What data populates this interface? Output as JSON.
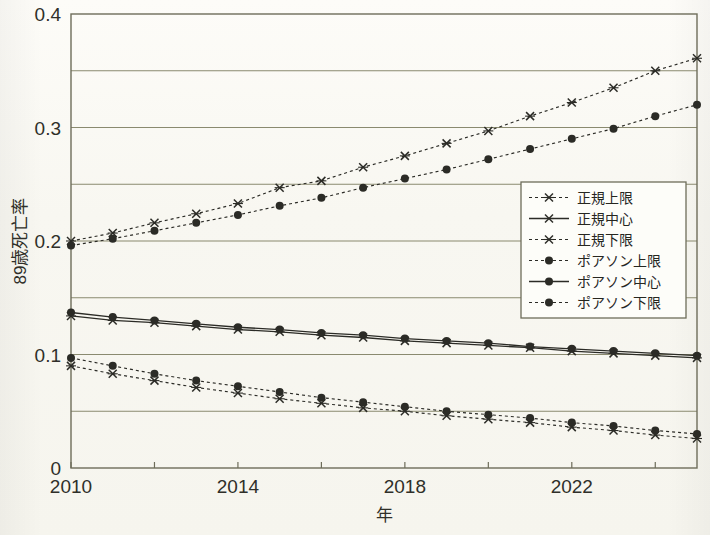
{
  "figure": {
    "background_color": "#fbfaf6",
    "frame_color": "#6e6d5a",
    "grid_color": "#8a8a6f",
    "ink_color": "#2b2b26"
  },
  "axes": {
    "y_title": "89歳死亡率",
    "x_title": "年",
    "y_tick_labels": [
      "0.4",
      "0.3",
      "0.2",
      "0.1",
      "0"
    ],
    "x_tick_labels": [
      "2010",
      "2014",
      "2018",
      "2022"
    ]
  },
  "legend": {
    "position": "center-right",
    "items": [
      {
        "label": "正規上限",
        "marker": "cross-marker",
        "line": "dashed"
      },
      {
        "label": "正規中心",
        "marker": "cross-marker",
        "line": "solid"
      },
      {
        "label": "正規下限",
        "marker": "cross-marker",
        "line": "dashed"
      },
      {
        "label": "ポアソン上限",
        "marker": "circle-marker",
        "line": "dashed"
      },
      {
        "label": "ポアソン中心",
        "marker": "circle-marker",
        "line": "solid"
      },
      {
        "label": "ポアソン下限",
        "marker": "circle-marker",
        "line": "dashed"
      }
    ]
  },
  "chart_data": {
    "type": "line",
    "title": "",
    "xlabel": "年",
    "ylabel": "89歳死亡率",
    "xlim": [
      2010,
      2025
    ],
    "ylim": [
      0,
      0.4
    ],
    "yticks": [
      0,
      0.05,
      0.1,
      0.15,
      0.2,
      0.25,
      0.3,
      0.35,
      0.4
    ],
    "ytick_labeled": [
      0,
      0.1,
      0.2,
      0.3,
      0.4
    ],
    "xticks": [
      2010,
      2012,
      2014,
      2016,
      2018,
      2020,
      2022,
      2024
    ],
    "xtick_labeled": [
      2010,
      2014,
      2018,
      2022
    ],
    "grid": "horizontal",
    "legend_position": "center-right",
    "x": [
      2010,
      2011,
      2012,
      2013,
      2014,
      2015,
      2016,
      2017,
      2018,
      2019,
      2020,
      2021,
      2022,
      2023,
      2024,
      2025
    ],
    "series": [
      {
        "name": "正規上限",
        "marker": "cross-marker",
        "line": "dashed",
        "values": [
          0.2,
          0.207,
          0.216,
          0.224,
          0.233,
          0.247,
          0.253,
          0.265,
          0.275,
          0.286,
          0.297,
          0.31,
          0.322,
          0.335,
          0.35,
          0.361
        ]
      },
      {
        "name": "正規中心",
        "marker": "cross-marker",
        "line": "solid",
        "values": [
          0.134,
          0.13,
          0.128,
          0.125,
          0.122,
          0.12,
          0.117,
          0.115,
          0.112,
          0.11,
          0.108,
          0.106,
          0.103,
          0.101,
          0.099,
          0.097
        ]
      },
      {
        "name": "正規下限",
        "marker": "cross-marker",
        "line": "dashed",
        "values": [
          0.09,
          0.083,
          0.077,
          0.071,
          0.066,
          0.061,
          0.057,
          0.053,
          0.05,
          0.046,
          0.043,
          0.04,
          0.036,
          0.033,
          0.029,
          0.026
        ]
      },
      {
        "name": "ポアソン上限",
        "marker": "circle-marker",
        "line": "dashed",
        "values": [
          0.196,
          0.202,
          0.209,
          0.216,
          0.223,
          0.231,
          0.238,
          0.247,
          0.255,
          0.263,
          0.272,
          0.281,
          0.29,
          0.299,
          0.31,
          0.32
        ]
      },
      {
        "name": "ポアソン中心",
        "marker": "circle-marker",
        "line": "solid",
        "values": [
          0.137,
          0.133,
          0.13,
          0.127,
          0.124,
          0.122,
          0.119,
          0.117,
          0.114,
          0.112,
          0.11,
          0.107,
          0.105,
          0.103,
          0.101,
          0.099
        ]
      },
      {
        "name": "ポアソン下限",
        "marker": "circle-marker",
        "line": "dashed",
        "values": [
          0.097,
          0.09,
          0.083,
          0.077,
          0.072,
          0.067,
          0.062,
          0.058,
          0.054,
          0.05,
          0.047,
          0.044,
          0.04,
          0.037,
          0.033,
          0.03
        ]
      }
    ]
  }
}
